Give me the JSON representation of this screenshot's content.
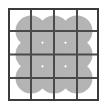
{
  "figure": {
    "canvas": {
      "width": 105,
      "height": 110,
      "background_color": "#ffffff"
    },
    "frame": {
      "x": 8,
      "y": 8,
      "width": 91,
      "height": 93,
      "stroke_color": "#3b3b3b",
      "stroke_width": 2,
      "fill_color": "#ffffff"
    },
    "grid": {
      "columns": 4,
      "rows": 4,
      "vertical_line_x": [
        31,
        54,
        77
      ],
      "horizontal_line_y": [
        31,
        54.5,
        78
      ],
      "line_color": "#4a4a4a",
      "line_width": 2
    },
    "circles": {
      "shape_color": "#b4b4b4",
      "radius": 15.5,
      "count": 9,
      "centers": [
        {
          "cx": 31,
          "cy": 31
        },
        {
          "cx": 54,
          "cy": 31
        },
        {
          "cx": 77,
          "cy": 31
        },
        {
          "cx": 31,
          "cy": 54.5
        },
        {
          "cx": 54,
          "cy": 54.5
        },
        {
          "cx": 77,
          "cy": 54.5
        },
        {
          "cx": 31,
          "cy": 78
        },
        {
          "cx": 54,
          "cy": 78
        },
        {
          "cx": 77,
          "cy": 78
        }
      ]
    }
  },
  "chart_data": {
    "type": "table",
    "xlabel": "",
    "ylabel": "",
    "categories": [
      "col-1",
      "col-2",
      "col-3",
      "col-4"
    ],
    "values": [
      4,
      4,
      4,
      4
    ],
    "legend": []
  }
}
